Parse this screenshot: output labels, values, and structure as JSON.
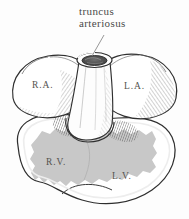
{
  "figure": {
    "name": "embryonic-heart-truncus-arteriosus",
    "background_color": "#fdfdfd",
    "ink_color": "#3a3a3a",
    "shading_color": "#c6c6c6",
    "label_color": "#55534f"
  },
  "callouts": [
    {
      "id": "truncus-arteriosus",
      "line1": "truncus",
      "line2": "arteriosus",
      "leader_from": [
        104,
        35
      ],
      "leader_to": [
        92,
        56
      ]
    }
  ],
  "chambers": [
    {
      "id": "right-atrium",
      "label": "R.A.",
      "x": 32,
      "y": 80
    },
    {
      "id": "left-atrium",
      "label": "L.A.",
      "x": 124,
      "y": 81
    },
    {
      "id": "right-ventricle",
      "label": "R.V.",
      "x": 46,
      "y": 157
    },
    {
      "id": "left-ventricle",
      "label": "L.V.",
      "x": 112,
      "y": 171
    }
  ],
  "structures": {
    "vessel_lumen_color": "#5d5d5d",
    "vessel_wall_color": "#ffffff",
    "ventricle_fill": "#c8c8c8",
    "groove_shadow": "#707070"
  }
}
